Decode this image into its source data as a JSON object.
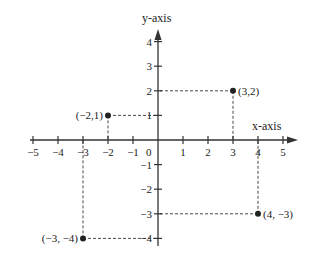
{
  "chart_data": {
    "type": "scatter",
    "title": "",
    "xlabel": "x-axis",
    "ylabel": "y-axis",
    "xlim": [
      -5,
      5
    ],
    "ylim": [
      -4,
      4
    ],
    "grid": false,
    "x_ticks": [
      -5,
      -4,
      -3,
      -2,
      -1,
      1,
      2,
      3,
      4,
      5
    ],
    "y_ticks": [
      -4,
      -3,
      -2,
      -1,
      1,
      2,
      3,
      4
    ],
    "x_tick_labels": [
      "−5",
      "−4",
      "−3",
      "−2",
      "−1",
      "1",
      "2",
      "3",
      "4",
      "5"
    ],
    "y_tick_labels": [
      "−4",
      "−3",
      "−2",
      "−1",
      "1",
      "2",
      "3",
      "4"
    ],
    "origin_label": "0",
    "points": [
      {
        "x": 3,
        "y": 2,
        "label": "(3,2)",
        "label_side": "right"
      },
      {
        "x": -2,
        "y": 1,
        "label": "(−2,1)",
        "label_side": "left"
      },
      {
        "x": 4,
        "y": -3,
        "label": "(4, −3)",
        "label_side": "right"
      },
      {
        "x": -3,
        "y": -4,
        "label": "(−3, −4)",
        "label_side": "left"
      }
    ],
    "projection_lines": "dashed lines from each point to both axes"
  },
  "colors": {
    "axis": "#333333",
    "point": "#222222",
    "dash": "#333333"
  }
}
